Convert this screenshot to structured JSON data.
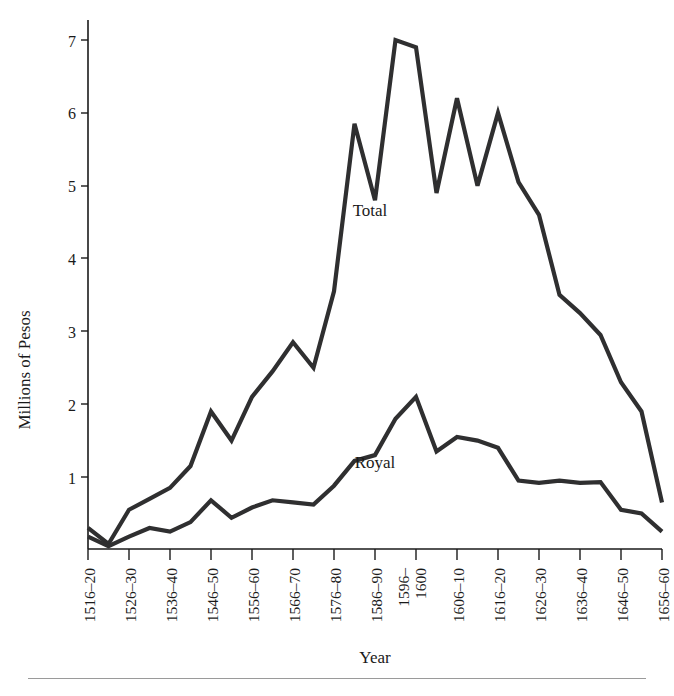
{
  "figure": {
    "background": "#ffffff",
    "line_color": "#2f2f30",
    "axis_color": "#1a1a1a",
    "rule_color": "#9a9a9a"
  },
  "axes": {
    "ylabel": "Millions of Pesos",
    "xlabel": "Year",
    "y_ticks": [
      "1",
      "2",
      "3",
      "4",
      "5",
      "6",
      "7"
    ],
    "x_tick_labels": [
      "1516–20",
      "",
      "1526–30",
      "",
      "1536–40",
      "",
      "1546–50",
      "",
      "1556–60",
      "",
      "1566–70",
      "",
      "1576–80",
      "",
      "1586–90",
      "",
      "1596–",
      "1600",
      "1606–10",
      "",
      "1616–20",
      "",
      "1626–30",
      "",
      "1636–40",
      "",
      "1646–50",
      "",
      "1656–60"
    ]
  },
  "annotations": {
    "total": "Total",
    "royal": "Royal"
  },
  "chart_data": {
    "type": "line",
    "title": "",
    "xlabel": "Year",
    "ylabel": "Millions of Pesos",
    "ylim": [
      0,
      7.3
    ],
    "grid": false,
    "legend": "inline-annotations",
    "x": [
      "1516–20",
      "1521–25",
      "1526–30",
      "1531–35",
      "1536–40",
      "1541–45",
      "1546–50",
      "1551–55",
      "1556–60",
      "1561–65",
      "1566–70",
      "1571–75",
      "1576–80",
      "1581–85",
      "1586–90",
      "1591–95",
      "1596–1600",
      "1601–05",
      "1606–10",
      "1611–15",
      "1616–20",
      "1621–25",
      "1626–30",
      "1631–35",
      "1636–40",
      "1641–45",
      "1646–50",
      "1651–55",
      "1656–60"
    ],
    "x_tick_labels_shown": [
      "1516–20",
      "1526–30",
      "1536–40",
      "1546–50",
      "1556–60",
      "1566–70",
      "1576–80",
      "1586–90",
      "1596–1600",
      "1606–10",
      "1616–20",
      "1626–30",
      "1636–40",
      "1646–50",
      "1656–60"
    ],
    "series": [
      {
        "name": "Total",
        "values": [
          0.3,
          0.08,
          0.55,
          0.7,
          0.85,
          1.15,
          1.9,
          1.5,
          2.1,
          2.45,
          2.85,
          2.5,
          3.55,
          5.85,
          4.8,
          7.0,
          6.9,
          4.9,
          6.2,
          5.0,
          6.0,
          5.05,
          4.6,
          3.5,
          3.25,
          2.95,
          2.3,
          1.9,
          0.65
        ]
      },
      {
        "name": "Royal",
        "values": [
          0.18,
          0.05,
          0.18,
          0.3,
          0.25,
          0.38,
          0.68,
          0.44,
          0.58,
          0.68,
          0.65,
          0.62,
          0.88,
          1.22,
          1.3,
          1.8,
          2.1,
          1.35,
          1.55,
          1.5,
          1.4,
          0.95,
          0.92,
          0.95,
          0.92,
          0.93,
          0.55,
          0.5,
          0.25
        ]
      }
    ]
  }
}
